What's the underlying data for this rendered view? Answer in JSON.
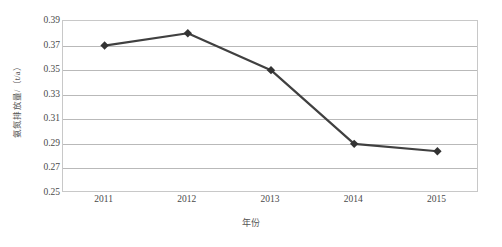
{
  "chart_data": {
    "type": "line",
    "title": "",
    "xlabel": "年份",
    "ylabel": "氨氮排放量/（t/a）",
    "categories": [
      "2011",
      "2012",
      "2013",
      "2014",
      "2015"
    ],
    "values": [
      0.37,
      0.38,
      0.35,
      0.29,
      0.284
    ],
    "series": [
      {
        "name": "氨氮排放量",
        "values": [
          0.37,
          0.38,
          0.35,
          0.29,
          0.284
        ]
      }
    ],
    "ylim": [
      0.25,
      0.39
    ],
    "ytick_step": 0.02,
    "ytick_labels": [
      "0.39",
      "0.37",
      "0.35",
      "0.33",
      "0.31",
      "0.29",
      "0.27",
      "0.25"
    ],
    "ytick_values": [
      0.39,
      0.37,
      0.35,
      0.33,
      0.31,
      0.29,
      0.27,
      0.25
    ],
    "grid": true,
    "legend": false,
    "legend_position": "none",
    "marker": "diamond",
    "line_color": "#404040",
    "marker_color": "#333333",
    "gridline_color": "#b9b9b9",
    "plot_border_color": "#c8c8c8"
  }
}
